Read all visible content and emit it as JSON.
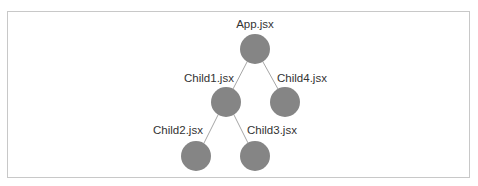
{
  "diagram": {
    "type": "tree",
    "title": "",
    "colors": {
      "node_fill": "#858585",
      "edge": "#a6a6a6",
      "label": "#333333",
      "border": "#c8c8c8"
    },
    "nodes": [
      {
        "id": "app",
        "label": "App.jsx",
        "cx": 255,
        "cy": 49,
        "r": 15,
        "label_x": 255,
        "label_y": 28
      },
      {
        "id": "child1",
        "label": "Child1.jsx",
        "cx": 226,
        "cy": 102,
        "r": 15,
        "label_x": 209,
        "label_y": 82
      },
      {
        "id": "child4",
        "label": "Child4.jsx",
        "cx": 285,
        "cy": 102,
        "r": 15,
        "label_x": 302,
        "label_y": 82
      },
      {
        "id": "child2",
        "label": "Child2.jsx",
        "cx": 196,
        "cy": 156,
        "r": 15,
        "label_x": 178,
        "label_y": 134
      },
      {
        "id": "child3",
        "label": "Child3.jsx",
        "cx": 255,
        "cy": 156,
        "r": 15,
        "label_x": 272,
        "label_y": 134
      }
    ],
    "edges": [
      {
        "from": "app",
        "to": "child1"
      },
      {
        "from": "app",
        "to": "child4"
      },
      {
        "from": "child1",
        "to": "child2"
      },
      {
        "from": "child1",
        "to": "child3"
      }
    ]
  }
}
